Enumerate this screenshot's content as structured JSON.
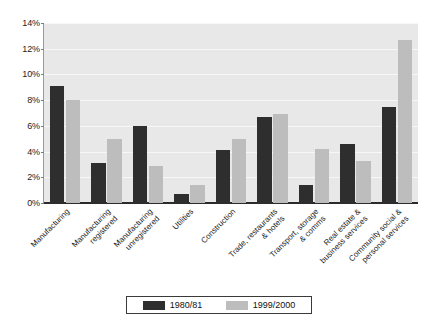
{
  "chart_data": {
    "type": "bar",
    "title": "",
    "xlabel": "",
    "ylabel": "",
    "ylim": [
      0,
      14
    ],
    "ytick_step": 2,
    "grid": true,
    "legend_position": "bottom",
    "categories": [
      "Manufacturing",
      "Manufacturing registered",
      "Manufacturing unregistered",
      "Utilities",
      "Construction",
      "Trade, restaurants & hotels",
      "Transport, storage & comms",
      "Real estate & business services",
      "Community social & personal services"
    ],
    "category_lines": [
      [
        "Manufacturing"
      ],
      [
        "Manufacturing",
        "registered"
      ],
      [
        "Manufacturing",
        "unregistered"
      ],
      [
        "Utilities"
      ],
      [
        "Construction"
      ],
      [
        "Trade, restaurants",
        "& hotels"
      ],
      [
        "Transport, storage",
        "& comms"
      ],
      [
        "Real estate &",
        "business services"
      ],
      [
        "Community social &",
        "personal services"
      ]
    ],
    "ytick_labels": [
      "0%",
      "2%",
      "4%",
      "6%",
      "8%",
      "10%",
      "12%",
      "14%"
    ],
    "ytick_values": [
      0,
      2,
      4,
      6,
      8,
      10,
      12,
      14
    ],
    "series": [
      {
        "name": "1980/81",
        "color": "#2e2e2e",
        "values": [
          9.1,
          3.1,
          6.0,
          0.7,
          4.1,
          6.7,
          1.4,
          4.6,
          7.5
        ]
      },
      {
        "name": "1999/2000",
        "color": "#bdbdbd",
        "values": [
          8.0,
          5.0,
          2.9,
          1.4,
          5.0,
          6.9,
          4.2,
          3.3,
          12.7
        ]
      }
    ]
  },
  "legend": {
    "items": [
      {
        "label": "1980/81",
        "color": "#2e2e2e"
      },
      {
        "label": "1999/2000",
        "color": "#bdbdbd"
      }
    ]
  },
  "colors": {
    "plot_background": "#e8e8e8",
    "gridline": "#f7f7f7",
    "axis": "#2b2b2b",
    "series_1980": "#2e2e2e",
    "series_1999": "#bdbdbd"
  }
}
